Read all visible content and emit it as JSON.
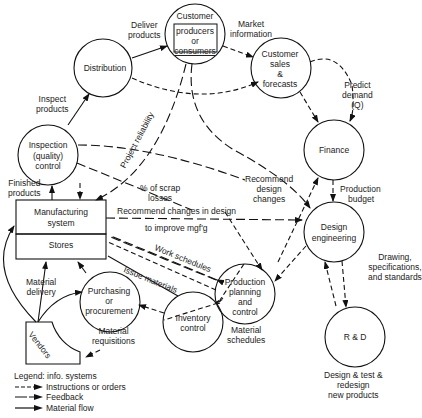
{
  "diagram": {
    "nodes": {
      "customer": {
        "title": "Customer",
        "l1": "producers",
        "l2": "or",
        "l3": "consumers"
      },
      "distribution": {
        "label": "Distribution"
      },
      "sales": {
        "l1": "Customer",
        "l2": "sales",
        "l3": "&",
        "l4": "forecasts"
      },
      "inspection": {
        "l1": "Inspection",
        "l2": "(quality)",
        "l3": "control"
      },
      "finance": {
        "label": "Finance"
      },
      "manufacturing": {
        "l1": "Manufacturing",
        "l2": "system"
      },
      "stores": {
        "label": "Stores"
      },
      "design": {
        "l1": "Design",
        "l2": "engineering"
      },
      "production": {
        "l1": "Production",
        "l2": "planning",
        "l3": "and",
        "l4": "control"
      },
      "purchasing": {
        "l1": "Purchasing",
        "l2": "or",
        "l3": "procurement"
      },
      "inventory": {
        "l1": "Inventory",
        "l2": "control"
      },
      "vendors": {
        "label": "Vendors"
      },
      "rnd": {
        "label": "R & D"
      }
    },
    "edge_labels": {
      "deliver_products": [
        "Deliver",
        "products"
      ],
      "market_information": [
        "Market",
        "information"
      ],
      "inspect_products": [
        "Inspect",
        "products"
      ],
      "predict_demand": [
        "Predict",
        "demand",
        "(Q)"
      ],
      "project_reliability": "Project reliability",
      "finished_products": [
        "Finished",
        "products"
      ],
      "scrap_losses": [
        "% of scrap",
        "losses"
      ],
      "recommend_design_changes": [
        "Recommend",
        "design",
        "changes"
      ],
      "production_budget": [
        "Production",
        "budget"
      ],
      "recommend_changes_in_design": "Recommend changes in design",
      "to_improve_mfg": "to improve mgf'g",
      "work_schedules": "Work schedules",
      "issue_materials": "Issue materials",
      "drawing_specs": [
        "Drawing,",
        "specifications,",
        "and standards"
      ],
      "material_delivery": [
        "Material",
        "delivery"
      ],
      "material_schedules": [
        "Material",
        "schedules"
      ],
      "material_requisitions": [
        "Material",
        "requisitions"
      ],
      "rnd_caption": [
        "Design & test &",
        "redesign",
        "new products"
      ]
    }
  },
  "legend": {
    "title": "Legend:  info. systems",
    "items": [
      {
        "style": "dashed",
        "label": "Instructions or orders"
      },
      {
        "style": "long-dash",
        "label": "Feedback"
      },
      {
        "style": "solid",
        "label": "Material flow"
      }
    ]
  }
}
